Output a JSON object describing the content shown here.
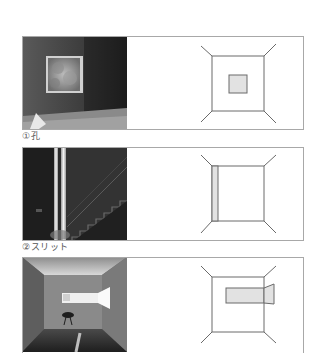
{
  "figures": [
    {
      "caption": "①孔",
      "photo_desc": "Room with square window framing foliage",
      "diagram_type": "hole"
    },
    {
      "caption": "②スリット",
      "photo_desc": "Stairwell lit by a vertical slit of light",
      "diagram_type": "slit"
    },
    {
      "caption": "",
      "photo_desc": "Room with horizontal window opening and chair",
      "diagram_type": "horizontal-window"
    }
  ],
  "colors": {
    "line": "#6a6a6a",
    "fill": "#e2e2e2",
    "frame": "#a8a8a8"
  }
}
